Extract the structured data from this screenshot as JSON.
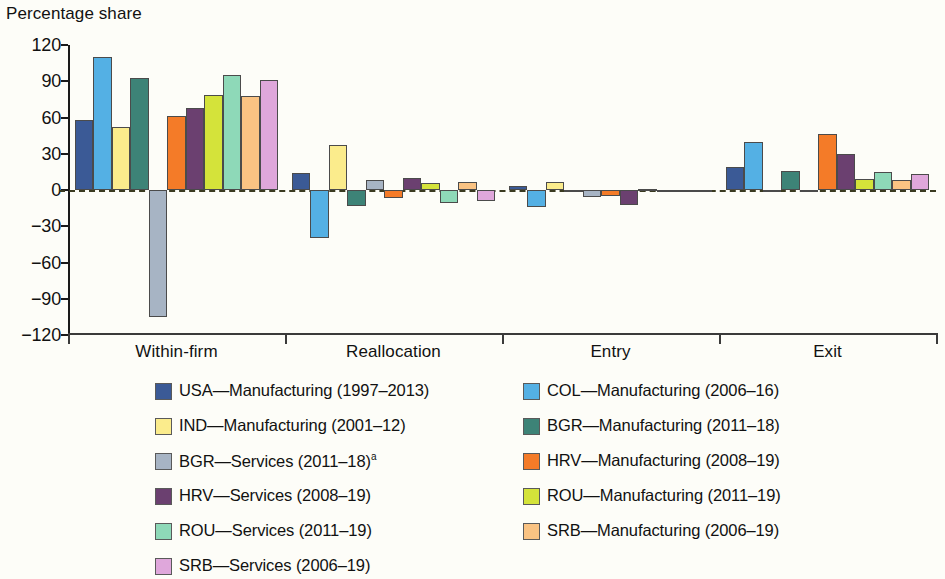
{
  "chart_data": {
    "type": "bar",
    "title": "",
    "ylabel": "Percentage share",
    "xlabel": "",
    "ylim": [
      -120,
      120
    ],
    "yticks": [
      120,
      90,
      60,
      30,
      0,
      -30,
      -60,
      -90,
      -120
    ],
    "ytick_labels": [
      "120",
      "90",
      "60",
      "30",
      "0",
      "−30",
      "−60",
      "−90",
      "−120"
    ],
    "grid": false,
    "legend_position": "bottom",
    "categories": [
      "Within-firm",
      "Reallocation",
      "Entry",
      "Exit"
    ],
    "series": [
      {
        "name": "USA—Manufacturing (1997–2013)",
        "color": "#3b5a96",
        "values": [
          58,
          14,
          3,
          19
        ]
      },
      {
        "name": "COL—Manufacturing (2006–16)",
        "color": "#54b0e4",
        "values": [
          110,
          -40,
          -14,
          40
        ]
      },
      {
        "name": "IND—Manufacturing (2001–12)",
        "color": "#fbec8c",
        "values": [
          52,
          37,
          7,
          0
        ]
      },
      {
        "name": "BGR—Manufacturing (2011–18)",
        "color": "#3d8377",
        "values": [
          93,
          -13,
          0,
          16
        ]
      },
      {
        "name": "BGR—Services (2011–18)",
        "color": "#a7b4c4",
        "values": [
          -105,
          8,
          -6,
          -2
        ]
      },
      {
        "name": "HRV—Manufacturing (2008–19)",
        "color": "#f47b28",
        "values": [
          61,
          -7,
          -5,
          46
        ]
      },
      {
        "name": "HRV—Services (2008–19)",
        "color": "#6b4070",
        "values": [
          68,
          10,
          -12,
          30
        ]
      },
      {
        "name": "ROU—Manufacturing (2011–19)",
        "color": "#d4e33a",
        "values": [
          79,
          6,
          1,
          9
        ]
      },
      {
        "name": "ROU—Services (2011–19)",
        "color": "#8ed9b8",
        "values": [
          95,
          -11,
          0,
          15
        ]
      },
      {
        "name": "SRB—Manufacturing (2006–19)",
        "color": "#fac383",
        "values": [
          78,
          7,
          0,
          8
        ]
      },
      {
        "name": "SRB—Services (2006–19)",
        "color": "#dfa7db",
        "values": [
          91,
          -9,
          0,
          13
        ]
      }
    ]
  },
  "legend": {
    "column_left": [
      {
        "label": "USA—Manufacturing (1997–2013)",
        "color": "#3b5a96",
        "footnote": ""
      },
      {
        "label": "IND—Manufacturing (2001–12)",
        "color": "#fbec8c",
        "footnote": ""
      },
      {
        "label": "BGR—Services (2011–18)",
        "color": "#a7b4c4",
        "footnote": "a"
      },
      {
        "label": "HRV—Services (2008–19)",
        "color": "#6b4070",
        "footnote": ""
      },
      {
        "label": "ROU—Services (2011–19)",
        "color": "#8ed9b8",
        "footnote": ""
      },
      {
        "label": "SRB—Services (2006–19)",
        "color": "#dfa7db",
        "footnote": ""
      }
    ],
    "column_right": [
      {
        "label": "COL—Manufacturing (2006–16)",
        "color": "#54b0e4",
        "footnote": ""
      },
      {
        "label": "BGR—Manufacturing (2011–18)",
        "color": "#3d8377",
        "footnote": ""
      },
      {
        "label": "HRV—Manufacturing (2008–19)",
        "color": "#f47b28",
        "footnote": ""
      },
      {
        "label": "ROU—Manufacturing (2011–19)",
        "color": "#d4e33a",
        "footnote": ""
      },
      {
        "label": "SRB—Manufacturing (2006–19)",
        "color": "#fac383",
        "footnote": ""
      }
    ]
  }
}
